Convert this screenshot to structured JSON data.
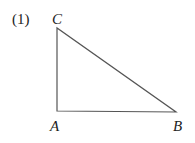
{
  "figure": {
    "number_label": "(1)",
    "stroke_color": "#555555",
    "vertices": {
      "A": {
        "label": "A",
        "x": 57,
        "y": 111
      },
      "B": {
        "label": "B",
        "x": 176,
        "y": 112
      },
      "C": {
        "label": "C",
        "x": 57,
        "y": 28
      }
    },
    "shape": "right triangle, right angle at A"
  }
}
